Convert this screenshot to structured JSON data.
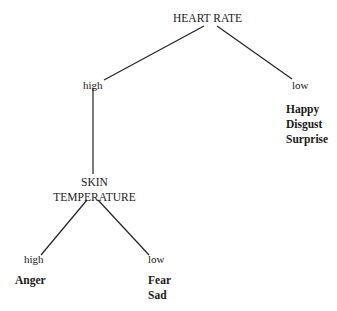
{
  "tree": {
    "root": {
      "label": "HEART RATE"
    },
    "root_branches": {
      "high": {
        "edge_label": "high"
      },
      "low": {
        "edge_label": "low",
        "outcomes": [
          "Happy",
          "Disgust",
          "Surprise"
        ]
      }
    },
    "sub": {
      "label_line1": "SKIN",
      "label_line2": "TEMPERATURE",
      "high": {
        "edge_label": "high",
        "outcomes": [
          "Anger"
        ]
      },
      "low": {
        "edge_label": "low",
        "outcomes": [
          "Fear",
          "Sad"
        ]
      }
    }
  },
  "colors": {
    "line": "#222222",
    "text": "#1a1a1a"
  }
}
